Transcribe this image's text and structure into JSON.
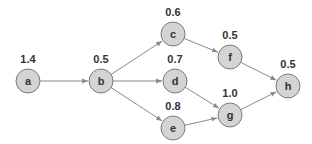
{
  "diagram": {
    "type": "directed-acyclic-graph",
    "style": {
      "node_fill": "#d4d4d4",
      "node_stroke": "#7a7a7a",
      "edge_color": "#8a8a8a",
      "text_color": "#333333"
    },
    "nodes": [
      {
        "id": "a",
        "label": "a",
        "weight": "1.4",
        "x": 28,
        "y": 81
      },
      {
        "id": "b",
        "label": "b",
        "weight": "0.5",
        "x": 101,
        "y": 81
      },
      {
        "id": "c",
        "label": "c",
        "weight": "0.6",
        "x": 173,
        "y": 34
      },
      {
        "id": "d",
        "label": "d",
        "weight": "0.7",
        "x": 175,
        "y": 81
      },
      {
        "id": "e",
        "label": "e",
        "weight": "0.8",
        "x": 173,
        "y": 128
      },
      {
        "id": "f",
        "label": "f",
        "weight": "0.5",
        "x": 230,
        "y": 57
      },
      {
        "id": "g",
        "label": "g",
        "weight": "1.0",
        "x": 230,
        "y": 115
      },
      {
        "id": "h",
        "label": "h",
        "weight": "0.5",
        "x": 288,
        "y": 86
      }
    ],
    "edges": [
      {
        "from": "a",
        "to": "b"
      },
      {
        "from": "b",
        "to": "c"
      },
      {
        "from": "b",
        "to": "d"
      },
      {
        "from": "b",
        "to": "e"
      },
      {
        "from": "c",
        "to": "f"
      },
      {
        "from": "d",
        "to": "g"
      },
      {
        "from": "e",
        "to": "g"
      },
      {
        "from": "f",
        "to": "h"
      },
      {
        "from": "g",
        "to": "h"
      }
    ]
  }
}
